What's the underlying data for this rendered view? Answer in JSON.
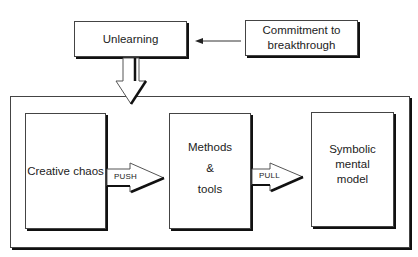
{
  "diagram": {
    "top_row": {
      "unlearning": {
        "label": "Unlearning"
      },
      "commitment": {
        "lines": [
          "Commitment to",
          "breakthrough"
        ]
      },
      "connector": {
        "from": "commitment",
        "to": "unlearning",
        "type": "thin-arrow"
      }
    },
    "down_arrow": {
      "from": "unlearning",
      "to": "process-container",
      "type": "block-arrow"
    },
    "process": {
      "boxes": [
        {
          "id": "creative-chaos",
          "lines": [
            "Creative chaos"
          ]
        },
        {
          "id": "methods-tools",
          "lines": [
            "Methods",
            "&",
            "tools"
          ]
        },
        {
          "id": "symbolic-mental-model",
          "lines": [
            "Symbolic",
            "mental",
            "model"
          ]
        }
      ],
      "arrows": [
        {
          "label": "PUSH",
          "from": "creative-chaos",
          "to": "methods-tools"
        },
        {
          "label": "PULL",
          "from": "methods-tools",
          "to": "symbolic-mental-model"
        }
      ]
    }
  },
  "colors": {
    "line": "#444444",
    "shadow": "#111111",
    "text": "#222222",
    "background": "#ffffff"
  }
}
